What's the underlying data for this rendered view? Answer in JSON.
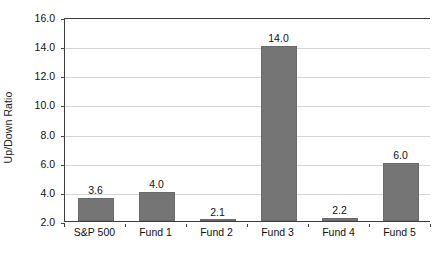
{
  "chart_data": {
    "type": "bar",
    "title": "",
    "subtitle": "",
    "xlabel": "",
    "ylabel": "Up/Down Ratio",
    "categories": [
      "S&P 500",
      "Fund 1",
      "Fund 2",
      "Fund 3",
      "Fund 4",
      "Fund 5"
    ],
    "values": [
      3.6,
      4.0,
      2.1,
      14.0,
      2.2,
      6.0
    ],
    "data_labels": [
      "3.6",
      "4.0",
      "2.1",
      "14.0",
      "2.2",
      "6.0"
    ],
    "ylim": [
      2.0,
      16.0
    ],
    "ytick_step": 2.0,
    "ytick_labels": [
      "2.0",
      "4.0",
      "6.0",
      "8.0",
      "10.0",
      "12.0",
      "14.0",
      "16.0"
    ],
    "ytick_values": [
      2.0,
      4.0,
      6.0,
      8.0,
      10.0,
      12.0,
      14.0,
      16.0
    ],
    "grid": true,
    "grid_axis": "y",
    "legend": false,
    "legend_position": "none",
    "series": [
      {
        "name": "Up/Down Ratio",
        "values": [
          3.6,
          4.0,
          2.1,
          14.0,
          2.2,
          6.0
        ]
      }
    ],
    "colors": {
      "bar_fill": "#757575",
      "bar_border": "#6a6a6a",
      "gridline": "#d6d6d6",
      "axis_line": "#3d3d3d",
      "text": "#111111",
      "background": "#ffffff"
    }
  }
}
